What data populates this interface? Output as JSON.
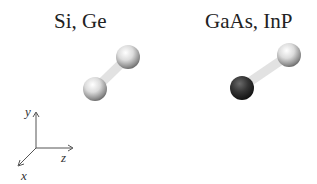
{
  "panels": [
    {
      "label": "Si, Ge",
      "atoms": [
        {
          "element_type": "same",
          "color": "#d8d8d8"
        },
        {
          "element_type": "same",
          "color": "#d8d8d8"
        }
      ]
    },
    {
      "label": "GaAs, InP",
      "atoms": [
        {
          "element_type": "cation",
          "color": "#d8d8d8"
        },
        {
          "element_type": "anion",
          "color": "#3a3a3a"
        }
      ]
    }
  ],
  "axes": {
    "x": "x",
    "y": "y",
    "z": "z"
  },
  "colors": {
    "light_atom": "#d8d8d8",
    "dark_atom": "#3a3a3a",
    "bond": "#e4e4e4",
    "axis": "#555555"
  }
}
